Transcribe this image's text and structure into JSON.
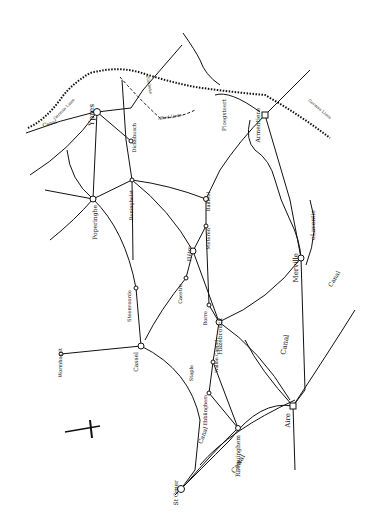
{
  "map": {
    "towns": [
      {
        "id": "ypres",
        "label": "Ypres",
        "x": 97,
        "y": 112,
        "lx": 94,
        "ly": 104,
        "size": 7.5
      },
      {
        "id": "poperinghe",
        "label": "Poperinghe",
        "x": 93,
        "y": 199,
        "lx": 97,
        "ly": 205,
        "size": 6
      },
      {
        "id": "reninghelst",
        "label": "Reninghelst",
        "x": 132,
        "y": 180,
        "lx": 133,
        "ly": 190,
        "size": 5
      },
      {
        "id": "dickebusch",
        "label": "Dickebusch",
        "x": 131,
        "y": 141,
        "lx": 136,
        "ly": 123,
        "size": 5
      },
      {
        "id": "armentiere",
        "label": "Armentiere",
        "x": 265,
        "y": 115,
        "lx": 260,
        "ly": 108,
        "size": 6
      },
      {
        "id": "bailleul",
        "label": "Bailleul",
        "x": 206,
        "y": 199,
        "lx": 210,
        "ly": 192,
        "size": 5
      },
      {
        "id": "meteren",
        "label": "Meteren",
        "x": 206,
        "y": 226,
        "lx": 210,
        "ly": 228,
        "size": 5
      },
      {
        "id": "flêtre",
        "label": "Flêtre",
        "x": 193,
        "y": 251,
        "lx": 191,
        "ly": 246,
        "size": 5
      },
      {
        "id": "caestre",
        "label": "Caestre",
        "x": 186,
        "y": 278,
        "lx": 182,
        "ly": 284,
        "size": 5
      },
      {
        "id": "borre",
        "label": "Borre",
        "x": 209,
        "y": 305,
        "lx": 207,
        "ly": 311,
        "size": 5
      },
      {
        "id": "hazebrouck",
        "label": "Hazebrouck",
        "x": 219,
        "y": 322,
        "lx": 222,
        "ly": 318,
        "size": 6
      },
      {
        "id": "merville",
        "label": "Merville",
        "x": 301,
        "y": 258,
        "lx": 298,
        "ly": 253,
        "size": 7
      },
      {
        "id": "steenvoorde",
        "label": "Steenvoorde",
        "x": 136,
        "y": 288,
        "lx": 131,
        "ly": 290,
        "size": 5
      },
      {
        "id": "wormhoudt",
        "label": "Wormhoudt",
        "x": 61,
        "y": 354,
        "lx": 62,
        "ly": 348,
        "size": 5
      },
      {
        "id": "cassel",
        "label": "Cassel",
        "x": 141,
        "y": 346,
        "lx": 138,
        "ly": 352,
        "size": 6
      },
      {
        "id": "staple",
        "label": "Staple",
        "x": 195,
        "y": 365,
        "lx": 193,
        "ly": 365,
        "size": 5
      },
      {
        "id": "wallon-cappel",
        "label": "Wallon Cappel",
        "x": 213,
        "y": 362,
        "lx": 218,
        "ly": 340,
        "size": 4.5
      },
      {
        "id": "ebblinghem",
        "label": "Ebblinghem",
        "x": 209,
        "y": 393,
        "lx": 207,
        "ly": 395,
        "size": 5
      },
      {
        "id": "racquinghem",
        "label": "Racquinghem",
        "x": 238,
        "y": 428,
        "lx": 240,
        "ly": 435,
        "size": 6
      },
      {
        "id": "st-omer",
        "label": "S^t Omer",
        "x": 181,
        "y": 489,
        "lx": 178,
        "ly": 480,
        "size": 6
      },
      {
        "id": "aire",
        "label": "Aire",
        "x": 293,
        "y": 406,
        "lx": 290,
        "ly": 413,
        "size": 7
      },
      {
        "id": "lavontie",
        "label": "oLaventie",
        "x": 315,
        "y": 225,
        "lx": 315,
        "ly": 225,
        "size": 6
      },
      {
        "id": "ploegsteert",
        "label": "Ploegsteert",
        "x": 229,
        "y": 114,
        "lx": 226,
        "ly": 115,
        "size": 5.5
      }
    ],
    "canal_labels": [
      {
        "label": "Canal",
        "x": 240,
        "y": 465,
        "rot": -60,
        "size": 7
      },
      {
        "label": "Canal",
        "x": 287,
        "y": 345,
        "rot": -80,
        "size": 7
      },
      {
        "label": "Canal",
        "x": 336,
        "y": 280,
        "rot": -60,
        "size": 6
      },
      {
        "label": "Canal",
        "x": 205,
        "y": 436,
        "rot": -70,
        "size": 6
      },
      {
        "label": "Canal",
        "x": 50,
        "y": 125,
        "rot": -15,
        "size": 5
      }
    ],
    "front_labels": [
      {
        "label": "German Lines",
        "x": 65,
        "y": 110,
        "rot": -45,
        "size": 4
      },
      {
        "label": "German Lines",
        "x": 319,
        "y": 110,
        "rot": 40,
        "size": 4
      },
      {
        "label": "Zillebeke",
        "x": 148,
        "y": 85,
        "rot": 80,
        "size": 4
      },
      {
        "label": "Allied Lines",
        "x": 170,
        "y": 118,
        "rot": -10,
        "size": 4
      }
    ],
    "compass": {
      "x": 90,
      "y": 430
    }
  }
}
